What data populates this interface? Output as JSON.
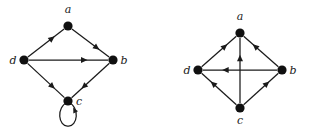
{
  "figure": {
    "background_color": "#ffffff",
    "ink_color": "#1a1a1a",
    "vertex_color": "#101010",
    "width": 315,
    "height": 134
  },
  "graphs": [
    {
      "id": "left",
      "name": "left-digraph",
      "type": "directed-graph",
      "vertices": [
        {
          "id": "a",
          "label": "a",
          "x": 68,
          "y": 26,
          "r": 4.6,
          "label_x": 68,
          "label_y": 13
        },
        {
          "id": "d",
          "label": "d",
          "x": 24,
          "y": 60,
          "r": 4.6,
          "label_x": 13,
          "label_y": 64
        },
        {
          "id": "b",
          "label": "b",
          "x": 113,
          "y": 60,
          "r": 4.6,
          "label_x": 124,
          "label_y": 64
        },
        {
          "id": "c",
          "label": "c",
          "x": 68,
          "y": 101,
          "r": 4.6,
          "label_x": 79,
          "label_y": 105
        }
      ],
      "edges": [
        {
          "from": "d",
          "to": "a",
          "label": "d-to-a",
          "directed": true
        },
        {
          "from": "a",
          "to": "b",
          "label": "a-to-b",
          "directed": true
        },
        {
          "from": "d",
          "to": "b",
          "label": "d-to-b",
          "directed": true
        },
        {
          "from": "d",
          "to": "c",
          "label": "d-to-c",
          "directed": true
        },
        {
          "from": "b",
          "to": "c",
          "label": "b-to-c",
          "directed": true
        }
      ],
      "self_loops": [
        {
          "at": "c",
          "label": "c-self-loop",
          "directed": true,
          "position": "below"
        }
      ]
    },
    {
      "id": "right",
      "name": "right-digraph",
      "type": "directed-graph",
      "vertices": [
        {
          "id": "a",
          "label": "a",
          "x": 85,
          "y": 33,
          "r": 4.6,
          "label_x": 85,
          "label_y": 20
        },
        {
          "id": "d",
          "label": "d",
          "x": 43,
          "y": 70,
          "r": 4.6,
          "label_x": 32,
          "label_y": 74
        },
        {
          "id": "b",
          "label": "b",
          "x": 127,
          "y": 70,
          "r": 4.6,
          "label_x": 138,
          "label_y": 74
        },
        {
          "id": "c",
          "label": "c",
          "x": 85,
          "y": 108,
          "r": 4.6,
          "label_x": 85,
          "label_y": 124
        }
      ],
      "edges": [
        {
          "from": "d",
          "to": "a",
          "label": "d-to-a",
          "directed": true
        },
        {
          "from": "b",
          "to": "a",
          "label": "b-to-a",
          "directed": true
        },
        {
          "from": "c",
          "to": "a",
          "label": "c-to-a",
          "directed": true
        },
        {
          "from": "b",
          "to": "d",
          "label": "b-to-d",
          "directed": true
        },
        {
          "from": "c",
          "to": "d",
          "label": "c-to-d",
          "directed": true
        },
        {
          "from": "c",
          "to": "b",
          "label": "c-to-b",
          "directed": true
        }
      ],
      "self_loops": []
    }
  ]
}
